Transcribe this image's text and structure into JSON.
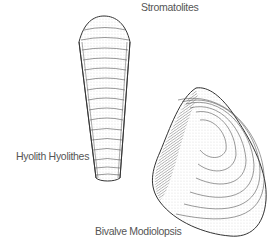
{
  "figure": {
    "labels": {
      "stromatolites": "Stromatolites",
      "hyolith": "Hyolith Hyolithes",
      "bivalve": "Bivalve Modiolopsis"
    },
    "colors": {
      "background": "#ffffff",
      "ink": "#333333",
      "label_text": "#555555"
    }
  }
}
